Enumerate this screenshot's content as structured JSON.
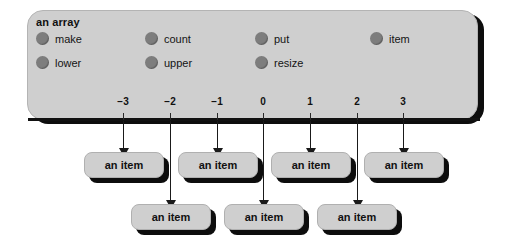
{
  "diagram": {
    "title": "an array",
    "features": [
      {
        "label": "make",
        "x": 36,
        "y": 32
      },
      {
        "label": "count",
        "x": 145,
        "y": 32
      },
      {
        "label": "put",
        "x": 255,
        "y": 32
      },
      {
        "label": "item",
        "x": 370,
        "y": 32
      },
      {
        "label": "lower",
        "x": 36,
        "y": 56
      },
      {
        "label": "upper",
        "x": 145,
        "y": 56
      },
      {
        "label": "resize",
        "x": 255,
        "y": 56
      }
    ],
    "axis": {
      "tick_labels": [
        "−3",
        "−2",
        "−1",
        "0",
        "1",
        "2",
        "3"
      ],
      "tick_x": [
        123,
        170,
        217,
        263,
        310,
        357,
        403
      ]
    },
    "arrows": [
      {
        "index": "−3",
        "x": 123,
        "row": "upper"
      },
      {
        "index": "−2",
        "x": 170,
        "row": "lower"
      },
      {
        "index": "−1",
        "x": 217,
        "row": "upper"
      },
      {
        "index": "0",
        "x": 263,
        "row": "lower"
      },
      {
        "index": "1",
        "x": 310,
        "row": "upper"
      },
      {
        "index": "2",
        "x": 357,
        "row": "lower"
      },
      {
        "index": "3",
        "x": 403,
        "row": "upper"
      }
    ],
    "item_boxes_upper": [
      {
        "label": "an item",
        "x": 84,
        "y": 152
      },
      {
        "label": "an item",
        "x": 178,
        "y": 152
      },
      {
        "label": "an item",
        "x": 271,
        "y": 152
      },
      {
        "label": "an item",
        "x": 364,
        "y": 152
      }
    ],
    "item_boxes_lower": [
      {
        "label": "an item",
        "x": 131,
        "y": 204
      },
      {
        "label": "an item",
        "x": 224,
        "y": 204
      },
      {
        "label": "an item",
        "x": 317,
        "y": 204
      }
    ],
    "colors": {
      "panel_fill": "#cfcfcf",
      "shadow": "#0d0d0d",
      "bullet": "#7d7d7d",
      "text": "#111111",
      "background": "#ffffff"
    }
  }
}
